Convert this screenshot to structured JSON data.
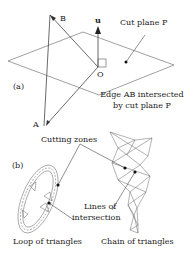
{
  "panel_a": {
    "label": "(a)",
    "point_A": "A",
    "point_B": "B",
    "point_O": "O",
    "vector_u": "u",
    "cut_plane_label": "Cut plane P",
    "edge_label_line1": "Edge AB intersected",
    "edge_label_line2": "by cut plane P"
  },
  "panel_b": {
    "label": "(b)",
    "cutting_zones": "Cutting zones",
    "lines_line1": "Lines of",
    "lines_line2": "intersection",
    "loop_caption": "Loop of triangles",
    "chain_caption": "Chain of triangles"
  },
  "colors": {
    "line": "#555555",
    "text": "#222222",
    "dot": "#111111"
  }
}
